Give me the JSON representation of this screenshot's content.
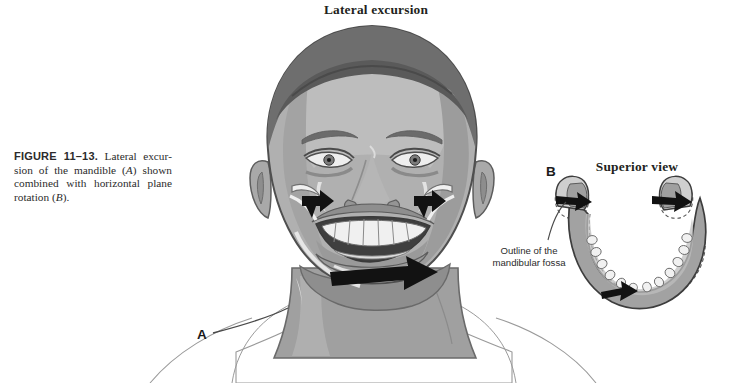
{
  "figure": {
    "caption_number": "FIGURE  11–13.",
    "caption_part1": " Lateral excur­sion of the mandible (",
    "caption_italic_a": "A",
    "caption_part2": ") shown combined with horizontal plane rotation (",
    "caption_italic_b": "B",
    "caption_part3": ").",
    "caption_full": "FIGURE 11–13. Lateral excursion of the mandible (A) shown combined with horizontal plane rotation (B)."
  },
  "panels": {
    "a": {
      "letter": "A",
      "title": "Lateral excursion",
      "description": "Frontal view illustration of a face with the mandible in lateral excursion; black arrows indicate direction of movement at both temporomandibular joints and at the chin."
    },
    "b": {
      "letter": "B",
      "title": "Superior view",
      "callout": "Outline of the mandibular fossa",
      "description": "Superior view of the mandible showing dashed outlines of the mandibular fossae and black arrows indicating condylar translation and rotation."
    }
  },
  "colors": {
    "background": "#ffffff",
    "skin_light": "#c2c2c2",
    "skin_mid": "#a8a8a8",
    "skin_shadow": "#8d8d8d",
    "hair_dark": "#6f6f6f",
    "hair_darker": "#5c5c5c",
    "outline": "#4a4a4a",
    "highlight": "#e8e8e8",
    "arrow_black": "#111111",
    "bone_gray": "#9d9d9d",
    "bone_light": "#cfcfcf",
    "tooth_white": "#f2f2f2",
    "text": "#231f20"
  }
}
